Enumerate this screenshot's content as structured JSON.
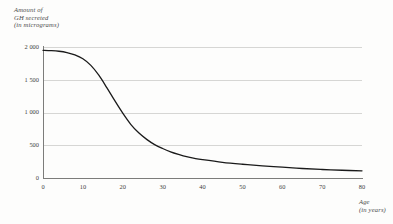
{
  "chart_data": {
    "type": "line",
    "title": "",
    "ylabel_lines": [
      "Amount of",
      "GH secreted",
      "(in micrograms)"
    ],
    "xlabel_lines": [
      "Age",
      "(in years)"
    ],
    "xlabel": "Age (in years)",
    "ylabel": "Amount of GH secreted (in micrograms)",
    "xlim": [
      0,
      80
    ],
    "ylim": [
      0,
      2000
    ],
    "grid": true,
    "legend": "none",
    "line_color": "#1a1a1a",
    "grid_color": "#d6d6d4",
    "axis_color": "#7c7c7a",
    "xticks": [
      0,
      10,
      20,
      30,
      40,
      50,
      60,
      70,
      80
    ],
    "xtick_labels": [
      "0",
      "10",
      "20",
      "30",
      "40",
      "50",
      "60",
      "70",
      "80"
    ],
    "yticks": [
      0,
      500,
      1000,
      1500,
      2000
    ],
    "ytick_labels": [
      "0",
      "500",
      "1 000",
      "1 500",
      "2 000"
    ],
    "x": [
      0,
      2,
      4,
      6,
      8,
      10,
      12,
      14,
      16,
      18,
      20,
      22,
      24,
      26,
      28,
      30,
      32,
      34,
      36,
      38,
      40,
      45,
      50,
      55,
      60,
      65,
      70,
      75,
      80
    ],
    "values": [
      1950,
      1945,
      1935,
      1915,
      1880,
      1820,
      1720,
      1570,
      1380,
      1180,
      990,
      820,
      690,
      590,
      510,
      450,
      400,
      360,
      325,
      300,
      280,
      240,
      210,
      185,
      165,
      145,
      130,
      118,
      110
    ]
  }
}
